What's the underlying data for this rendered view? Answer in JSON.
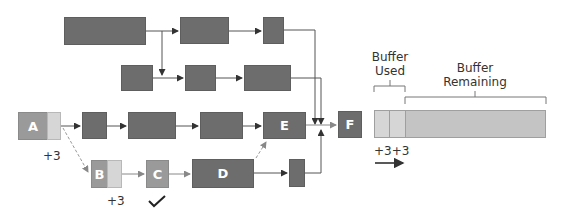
{
  "tasks": {
    "A": "A",
    "B": "B",
    "C": "C",
    "D": "D",
    "E": "E",
    "F": "F"
  },
  "annotations": {
    "a_delay": "+3",
    "b_delay": "+3",
    "buffer_delays": "+3+3",
    "c_status": "✔"
  },
  "buffer": {
    "used_label": "Buffer\nUsed",
    "used_line1": "Buffer",
    "used_line2": "Used",
    "remaining_line1": "Buffer",
    "remaining_line2": "Remaining"
  },
  "colors": {
    "task": "#6d6d6d",
    "task_mid": "#9a9a9a",
    "buffer_used": "#d6d6d6",
    "buffer_remaining": "#c4c4c4",
    "line": "#7a7a7a"
  }
}
